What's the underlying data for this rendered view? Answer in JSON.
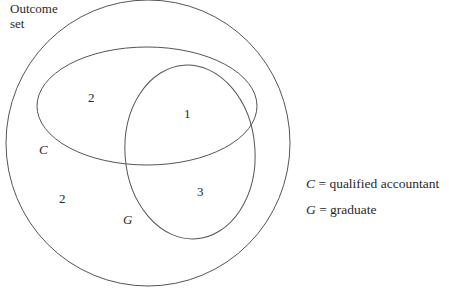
{
  "diagram": {
    "type": "venn",
    "universe_label": [
      "Outcome",
      "set"
    ],
    "sets": [
      {
        "id": "C",
        "label": "C"
      },
      {
        "id": "G",
        "label": "G"
      }
    ],
    "regions": {
      "C_only": "2",
      "C_and_G": "1",
      "G_only": "3",
      "neither": "2"
    },
    "legend": [
      {
        "symbol": "C",
        "text": " = qualified accountant"
      },
      {
        "symbol": "G",
        "text": " = graduate"
      }
    ],
    "stroke_color": "#555555"
  }
}
